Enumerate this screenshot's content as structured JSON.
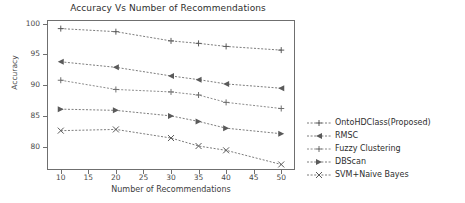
{
  "chart_data": {
    "type": "line",
    "title": "Accuracy Vs Number of Recommendations",
    "xlabel": "Number of Recommendations",
    "ylabel": "Accuracy",
    "x": [
      10,
      20,
      30,
      35,
      40,
      50
    ],
    "xlim": [
      7.5,
      52.5
    ],
    "ylim": [
      76.2,
      100.6
    ],
    "xticks": [
      10,
      15,
      20,
      25,
      30,
      35,
      40,
      45,
      50
    ],
    "yticks": [
      80,
      85,
      90,
      95,
      100
    ],
    "grid": false,
    "legend_position": "outside-right",
    "line_style": "dashed",
    "series": [
      {
        "name": "OntoHDClass(Proposed)",
        "marker": "plus",
        "color": "#5a5a5a",
        "values": [
          99.2,
          98.7,
          97.2,
          96.8,
          96.3,
          95.7
        ]
      },
      {
        "name": "RMSC",
        "marker": "triangle-left",
        "color": "#5a5a5a",
        "values": [
          93.8,
          92.9,
          91.5,
          90.9,
          90.2,
          89.5
        ]
      },
      {
        "name": "Fuzzy Clustering",
        "marker": "plus",
        "color": "#6e6e6e",
        "values": [
          90.8,
          89.3,
          88.9,
          88.4,
          87.2,
          86.2
        ]
      },
      {
        "name": "DBScan",
        "marker": "triangle-right",
        "color": "#5a5a5a",
        "values": [
          86.1,
          85.9,
          85.0,
          84.1,
          83.0,
          82.1
        ]
      },
      {
        "name": "SVM+Naive Bayes",
        "marker": "x-cross",
        "color": "#5a5a5a",
        "values": [
          82.6,
          82.8,
          81.4,
          80.1,
          79.4,
          77.1
        ]
      }
    ]
  }
}
